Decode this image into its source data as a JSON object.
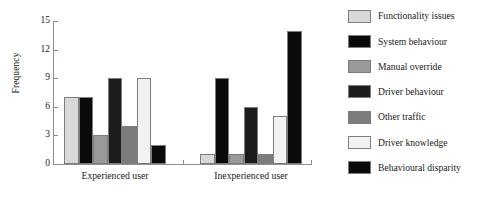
{
  "chart_data": {
    "type": "bar",
    "title": "",
    "xlabel": "",
    "ylabel": "Frequency",
    "categories": [
      "Experienced user",
      "Inexperienced user"
    ],
    "ylim": [
      0,
      15
    ],
    "yticks": [
      "0",
      "3",
      "6",
      "9",
      "12",
      "15"
    ],
    "grid": false,
    "legend_position": "right",
    "series": [
      {
        "name": "Functionality issues",
        "color": "#d9d9d9",
        "values": [
          7,
          1
        ]
      },
      {
        "name": "System behaviour",
        "color": "#0a0a0a",
        "values": [
          7,
          9
        ]
      },
      {
        "name": "Manual override",
        "color": "#9a9a9a",
        "values": [
          3,
          1
        ]
      },
      {
        "name": "Driver behaviour",
        "color": "#1c1c1c",
        "values": [
          9,
          6
        ]
      },
      {
        "name": "Other traffic",
        "color": "#7c7c7c",
        "values": [
          4,
          1
        ]
      },
      {
        "name": "Driver knowledge",
        "color": "#f2f2f2",
        "values": [
          9,
          5
        ]
      },
      {
        "name": "Behavioural disparity",
        "color": "#0a0a0a",
        "values": [
          2,
          14
        ]
      }
    ]
  },
  "axis": {
    "y_title": "Frequency",
    "y_ticks": [
      "0",
      "3",
      "6",
      "9",
      "12",
      "15"
    ],
    "x_labels": [
      "Experienced user",
      "Inexperienced user"
    ]
  },
  "legend": {
    "items": [
      {
        "label": "Functionality issues",
        "color": "#d9d9d9"
      },
      {
        "label": "System behaviour",
        "color": "#0a0a0a"
      },
      {
        "label": "Manual override",
        "color": "#9a9a9a"
      },
      {
        "label": "Driver behaviour",
        "color": "#1c1c1c"
      },
      {
        "label": "Other traffic",
        "color": "#7c7c7c"
      },
      {
        "label": "Driver knowledge",
        "color": "#f2f2f2"
      },
      {
        "label": "Behavioural disparity",
        "color": "#0a0a0a"
      }
    ]
  }
}
